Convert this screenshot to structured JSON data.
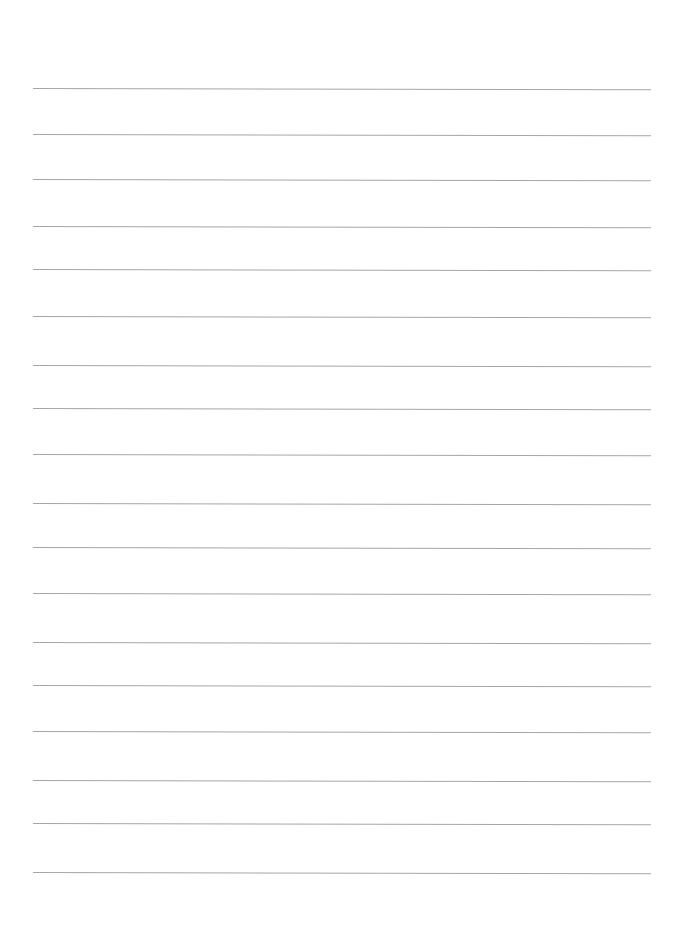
{
  "document": {
    "type": "lined-paper",
    "background_color": "#ffffff",
    "line_color": "#a6a6a6",
    "line_left_x": 33,
    "line_right_x": 651,
    "lines": [
      {
        "y": 88,
        "text": ""
      },
      {
        "y": 134,
        "text": ""
      },
      {
        "y": 179,
        "text": ""
      },
      {
        "y": 226,
        "text": ""
      },
      {
        "y": 269,
        "text": ""
      },
      {
        "y": 316,
        "text": ""
      },
      {
        "y": 365,
        "text": ""
      },
      {
        "y": 408,
        "text": ""
      },
      {
        "y": 454,
        "text": ""
      },
      {
        "y": 503,
        "text": ""
      },
      {
        "y": 547,
        "text": ""
      },
      {
        "y": 593,
        "text": ""
      },
      {
        "y": 642,
        "text": ""
      },
      {
        "y": 685,
        "text": ""
      },
      {
        "y": 731,
        "text": ""
      },
      {
        "y": 780,
        "text": ""
      },
      {
        "y": 823,
        "text": ""
      },
      {
        "y": 872,
        "text": ""
      }
    ]
  }
}
